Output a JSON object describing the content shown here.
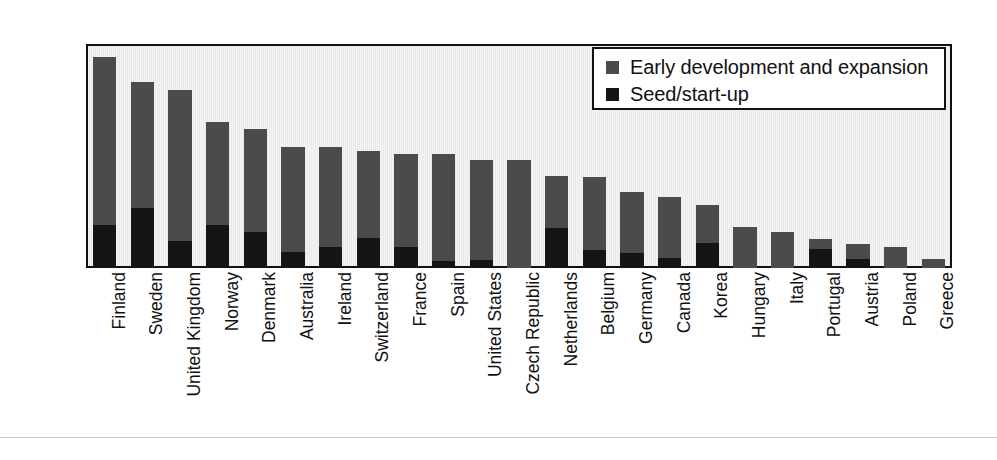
{
  "chart_data": {
    "type": "bar",
    "subtype": "stacked-vertical",
    "title": "",
    "subtitle": "",
    "xlabel": "",
    "ylabel": "",
    "ylim": [
      0.0,
      0.25
    ],
    "ytick_labels": [
      "0.25",
      "0.20",
      "0.15",
      "0.10",
      "0.05",
      "0.00"
    ],
    "ytick_values": [
      0.25,
      0.2,
      0.15,
      0.1,
      0.05,
      0.0
    ],
    "grid": false,
    "legend_position": "top-right",
    "categories": [
      "Finland",
      "Sweden",
      "United Kingdom",
      "Norway",
      "Denmark",
      "Australia",
      "Ireland",
      "Switzerland",
      "France",
      "Spain",
      "United States",
      "Czech Republic",
      "Netherlands",
      "Belgium",
      "Germany",
      "Canada",
      "Korea",
      "Hungary",
      "Italy",
      "Portugal",
      "Austria",
      "Poland",
      "Greece"
    ],
    "series": [
      {
        "name": "Seed/start-up",
        "color": "#151515",
        "values": [
          0.048,
          0.067,
          0.03,
          0.048,
          0.04,
          0.018,
          0.023,
          0.033,
          0.024,
          0.008,
          0.009,
          0.0,
          0.045,
          0.02,
          0.017,
          0.011,
          0.028,
          0.0,
          0.0,
          0.021,
          0.01,
          0.0,
          0.0
        ]
      },
      {
        "name": "Early development and expansion",
        "color": "#4b4b4b",
        "values": [
          0.188,
          0.141,
          0.169,
          0.115,
          0.115,
          0.117,
          0.112,
          0.098,
          0.103,
          0.119,
          0.112,
          0.121,
          0.058,
          0.082,
          0.068,
          0.068,
          0.042,
          0.046,
          0.04,
          0.011,
          0.017,
          0.023,
          0.01
        ]
      }
    ],
    "totals": [
      0.236,
      0.208,
      0.199,
      0.163,
      0.155,
      0.135,
      0.135,
      0.131,
      0.127,
      0.127,
      0.121,
      0.121,
      0.103,
      0.102,
      0.085,
      0.079,
      0.07,
      0.046,
      0.04,
      0.032,
      0.027,
      0.023,
      0.01
    ]
  },
  "legend": {
    "entries": [
      {
        "label": "Early development and expansion",
        "color": "#4b4b4b"
      },
      {
        "label": "Seed/start-up",
        "color": "#151515"
      }
    ]
  },
  "colors": {
    "series_early": "#4b4b4b",
    "series_seed": "#151515",
    "plot_background": "#e9e9e9",
    "axis": "#111111",
    "page_background": "#ffffff"
  }
}
